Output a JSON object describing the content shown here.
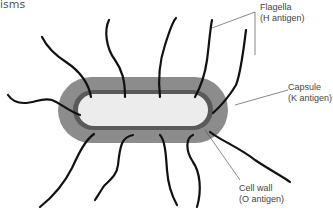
{
  "caption": {
    "fragment": "isms"
  },
  "diagram": {
    "colors": {
      "capsule": "#8c8c8c",
      "cell_wall": "#5a5a5a",
      "cytoplasm": "#ececec",
      "flagella": "#111111",
      "leader": "#555555"
    },
    "labels": [
      {
        "id": "flagella",
        "line1": "Flagella",
        "line2": "(H antigen)"
      },
      {
        "id": "capsule",
        "line1": "Capsule",
        "line2": "(K antigen)"
      },
      {
        "id": "cell-wall",
        "line1": "Cell wall",
        "line2": "(O antigen)"
      }
    ]
  }
}
